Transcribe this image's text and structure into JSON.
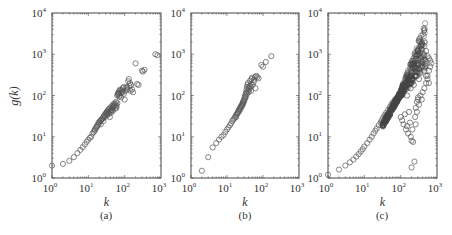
{
  "figure": {
    "ylabel": "g(k)",
    "panels_caption": [
      "(a)",
      "(b)",
      "(c)"
    ]
  },
  "chart_data": [
    {
      "type": "scatter",
      "panel": "(a)",
      "title": "",
      "xlabel": "k",
      "ylabel": "g(k)",
      "xscale": "log",
      "yscale": "log",
      "xlim": [
        1,
        1000
      ],
      "ylim": [
        1,
        10000
      ],
      "xticks": [
        "10^0",
        "10^1",
        "10^2",
        "10^3"
      ],
      "yticks": [
        "10^0",
        "10^1",
        "10^2",
        "10^3",
        "10^4"
      ],
      "grid": false,
      "marker": "open-circle",
      "points": [
        [
          1,
          2
        ],
        [
          2,
          2.2
        ],
        [
          3,
          2.6
        ],
        [
          4,
          3.2
        ],
        [
          5,
          4
        ],
        [
          6,
          4.8
        ],
        [
          7,
          5.6
        ],
        [
          8,
          6.5
        ],
        [
          9,
          7.5
        ],
        [
          10,
          8.5
        ],
        [
          11,
          9.5
        ],
        [
          12,
          10
        ],
        [
          13,
          12
        ],
        [
          14,
          13
        ],
        [
          15,
          15
        ],
        [
          16,
          16
        ],
        [
          17,
          18
        ],
        [
          18,
          19
        ],
        [
          19,
          20
        ],
        [
          20,
          22
        ],
        [
          21,
          24
        ],
        [
          22,
          25
        ],
        [
          23,
          26
        ],
        [
          25,
          28
        ],
        [
          26,
          30
        ],
        [
          27,
          32
        ],
        [
          28,
          34
        ],
        [
          30,
          36
        ],
        [
          31,
          38
        ],
        [
          32,
          40
        ],
        [
          33,
          35
        ],
        [
          34,
          42
        ],
        [
          35,
          45
        ],
        [
          36,
          40
        ],
        [
          38,
          48
        ],
        [
          40,
          50
        ],
        [
          42,
          38
        ],
        [
          44,
          55
        ],
        [
          45,
          45
        ],
        [
          48,
          60
        ],
        [
          50,
          52
        ],
        [
          52,
          65
        ],
        [
          55,
          48
        ],
        [
          58,
          70
        ],
        [
          60,
          55
        ],
        [
          62,
          100
        ],
        [
          65,
          110
        ],
        [
          68,
          120
        ],
        [
          70,
          95
        ],
        [
          72,
          130
        ],
        [
          75,
          140
        ],
        [
          78,
          115
        ],
        [
          80,
          90
        ],
        [
          85,
          125
        ],
        [
          90,
          150
        ],
        [
          95,
          110
        ],
        [
          100,
          80
        ],
        [
          110,
          160
        ],
        [
          120,
          140
        ],
        [
          130,
          250
        ],
        [
          140,
          200
        ],
        [
          150,
          180
        ],
        [
          160,
          140
        ],
        [
          170,
          120
        ],
        [
          200,
          600
        ],
        [
          220,
          190
        ],
        [
          240,
          180
        ],
        [
          300,
          400
        ],
        [
          320,
          380
        ],
        [
          350,
          420
        ],
        [
          700,
          1000
        ],
        [
          800,
          950
        ],
        [
          15,
          14
        ],
        [
          17,
          17
        ],
        [
          19,
          22
        ],
        [
          22,
          20
        ],
        [
          24,
          27
        ],
        [
          26,
          24
        ],
        [
          29,
          30
        ],
        [
          33,
          33
        ],
        [
          37,
          37
        ],
        [
          39,
          30
        ],
        [
          41,
          42
        ],
        [
          43,
          45
        ],
        [
          46,
          50
        ],
        [
          47,
          42
        ],
        [
          49,
          55
        ],
        [
          53,
          58
        ],
        [
          56,
          62
        ],
        [
          59,
          50
        ],
        [
          63,
          65
        ],
        [
          66,
          105
        ],
        [
          69,
          115
        ],
        [
          74,
          100
        ],
        [
          82,
          135
        ],
        [
          88,
          120
        ],
        [
          92,
          160
        ],
        [
          105,
          130
        ],
        [
          115,
          150
        ],
        [
          125,
          220
        ],
        [
          135,
          170
        ],
        [
          145,
          130
        ]
      ]
    },
    {
      "type": "scatter",
      "panel": "(b)",
      "title": "",
      "xlabel": "k",
      "ylabel": "",
      "xscale": "log",
      "yscale": "log",
      "xlim": [
        1,
        1000
      ],
      "ylim": [
        1,
        10000
      ],
      "xticks": [
        "10^0",
        "10^1",
        "10^2",
        "10^3"
      ],
      "yticks": [
        "10^0",
        "10^1",
        "10^2",
        "10^3",
        "10^4"
      ],
      "grid": false,
      "marker": "open-circle",
      "points": [
        [
          2,
          1.5
        ],
        [
          3,
          3.2
        ],
        [
          4,
          5.5
        ],
        [
          5,
          7
        ],
        [
          6,
          8.5
        ],
        [
          7,
          10
        ],
        [
          8,
          11
        ],
        [
          9,
          13
        ],
        [
          10,
          15
        ],
        [
          11,
          17
        ],
        [
          12,
          19
        ],
        [
          13,
          21
        ],
        [
          14,
          24
        ],
        [
          15,
          26
        ],
        [
          16,
          28
        ],
        [
          17,
          31
        ],
        [
          18,
          34
        ],
        [
          19,
          36
        ],
        [
          20,
          40
        ],
        [
          21,
          43
        ],
        [
          22,
          46
        ],
        [
          23,
          50
        ],
        [
          24,
          53
        ],
        [
          25,
          56
        ],
        [
          26,
          60
        ],
        [
          27,
          65
        ],
        [
          28,
          70
        ],
        [
          29,
          75
        ],
        [
          30,
          80
        ],
        [
          31,
          90
        ],
        [
          32,
          100
        ],
        [
          33,
          110
        ],
        [
          34,
          120
        ],
        [
          35,
          140
        ],
        [
          36,
          160
        ],
        [
          37,
          180
        ],
        [
          38,
          200
        ],
        [
          40,
          150
        ],
        [
          42,
          170
        ],
        [
          44,
          230
        ],
        [
          46,
          190
        ],
        [
          48,
          250
        ],
        [
          50,
          270
        ],
        [
          55,
          210
        ],
        [
          60,
          280
        ],
        [
          65,
          300
        ],
        [
          70,
          280
        ],
        [
          75,
          260
        ],
        [
          90,
          550
        ],
        [
          100,
          500
        ],
        [
          120,
          650
        ],
        [
          170,
          900
        ],
        [
          18,
          30
        ],
        [
          20,
          37
        ],
        [
          22,
          42
        ],
        [
          24,
          48
        ],
        [
          26,
          55
        ],
        [
          28,
          62
        ],
        [
          30,
          72
        ],
        [
          32,
          85
        ],
        [
          34,
          95
        ],
        [
          36,
          110
        ],
        [
          38,
          130
        ],
        [
          40,
          120
        ],
        [
          42,
          140
        ],
        [
          45,
          160
        ],
        [
          47,
          130
        ],
        [
          52,
          180
        ],
        [
          57,
          240
        ],
        [
          62,
          150
        ]
      ]
    },
    {
      "type": "scatter",
      "panel": "(c)",
      "title": "",
      "xlabel": "k",
      "ylabel": "",
      "xscale": "log",
      "yscale": "log",
      "xlim": [
        1,
        1000
      ],
      "ylim": [
        1,
        10000
      ],
      "xticks": [
        "10^0",
        "10^1",
        "10^2",
        "10^3"
      ],
      "yticks": [
        "10^0",
        "10^1",
        "10^2",
        "10^3",
        "10^4"
      ],
      "grid": false,
      "marker": "open-circle",
      "points": [
        [
          1,
          1.2
        ],
        [
          2,
          1.6
        ],
        [
          3,
          2
        ],
        [
          4,
          2.4
        ],
        [
          5,
          2.8
        ],
        [
          6,
          3.3
        ],
        [
          7,
          3.8
        ],
        [
          8,
          4.4
        ],
        [
          9,
          5
        ],
        [
          10,
          5.8
        ],
        [
          12,
          7
        ],
        [
          14,
          8.5
        ],
        [
          16,
          10
        ],
        [
          18,
          12
        ],
        [
          20,
          14
        ],
        [
          22,
          16
        ],
        [
          25,
          19
        ],
        [
          28,
          22
        ],
        [
          30,
          25
        ],
        [
          33,
          29
        ],
        [
          36,
          33
        ],
        [
          40,
          38
        ],
        [
          45,
          45
        ],
        [
          50,
          52
        ],
        [
          55,
          60
        ],
        [
          60,
          68
        ],
        [
          70,
          80
        ],
        [
          80,
          90
        ],
        [
          90,
          110
        ],
        [
          100,
          130
        ],
        [
          120,
          160
        ],
        [
          140,
          200
        ],
        [
          160,
          250
        ],
        [
          180,
          300
        ],
        [
          200,
          350
        ],
        [
          250,
          450
        ],
        [
          300,
          550
        ],
        [
          350,
          600
        ],
        [
          400,
          650
        ],
        [
          500,
          1200
        ],
        [
          550,
          900
        ],
        [
          600,
          800
        ],
        [
          650,
          700
        ],
        [
          100,
          30
        ],
        [
          110,
          25
        ],
        [
          120,
          20
        ],
        [
          130,
          35
        ],
        [
          140,
          15
        ],
        [
          150,
          18
        ],
        [
          160,
          12
        ],
        [
          170,
          40
        ],
        [
          180,
          22
        ],
        [
          190,
          10
        ],
        [
          200,
          8
        ],
        [
          210,
          15
        ],
        [
          220,
          7.5
        ],
        [
          200,
          1.8
        ],
        [
          240,
          2.5
        ],
        [
          250,
          30
        ],
        [
          260,
          50
        ],
        [
          280,
          70
        ],
        [
          300,
          90
        ],
        [
          320,
          60
        ],
        [
          350,
          100
        ],
        [
          380,
          80
        ],
        [
          400,
          120
        ],
        [
          450,
          150
        ],
        [
          500,
          200
        ],
        [
          550,
          300
        ],
        [
          600,
          400
        ],
        [
          650,
          500
        ],
        [
          700,
          600
        ],
        [
          220,
          700
        ],
        [
          300,
          80
        ],
        [
          280,
          40
        ],
        [
          260,
          20
        ],
        [
          110,
          100
        ],
        [
          130,
          150
        ],
        [
          150,
          100
        ],
        [
          170,
          200
        ],
        [
          190,
          150
        ],
        [
          210,
          250
        ],
        [
          230,
          180
        ],
        [
          260,
          300
        ],
        [
          290,
          400
        ],
        [
          320,
          250
        ],
        [
          350,
          350
        ],
        [
          400,
          500
        ],
        [
          450,
          400
        ],
        [
          500,
          300
        ],
        [
          550,
          250
        ],
        [
          600,
          200
        ]
      ]
    }
  ]
}
